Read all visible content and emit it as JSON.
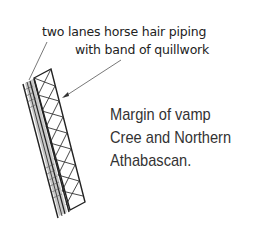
{
  "callouts": [
    {
      "text_line1": "two lanes horse hair piping",
      "text_line2": "with band of quillwork"
    }
  ],
  "caption": {
    "line1": "Margin of vamp",
    "line2": "Cree and Northern",
    "line3": "Athabascan."
  },
  "colors": {
    "line": "#222222",
    "fill": "#bbbbbb",
    "text": "#333333"
  }
}
